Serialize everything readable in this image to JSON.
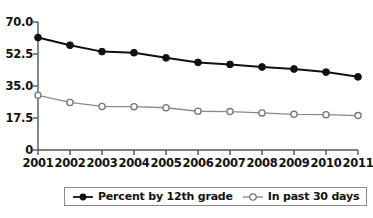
{
  "chart_data": {
    "type": "line",
    "title": "",
    "xlabel": "",
    "ylabel": "",
    "categories": [
      "2001",
      "2002",
      "2003",
      "2004",
      "2005",
      "2006",
      "2007",
      "2008",
      "2009",
      "2010",
      "2011"
    ],
    "x": [
      2001,
      2002,
      2003,
      2004,
      2005,
      2006,
      2007,
      2008,
      2009,
      2010,
      2011
    ],
    "ylim": [
      0,
      70
    ],
    "xlim": [
      2001,
      2011
    ],
    "grid": false,
    "legend_position": "bottom",
    "yticks": [
      0,
      17.5,
      35.0,
      52.5,
      70.0
    ],
    "ytick_labels": [
      "0",
      "17.5",
      "35.0",
      "52.5",
      "70.0"
    ],
    "xtick_labels": [
      "2001",
      "2002",
      "2003",
      "2004",
      "2005",
      "2006",
      "2007",
      "2008",
      "2009",
      "2010",
      "2011"
    ],
    "series": [
      {
        "name": "Percent by 12th grade",
        "marker": "filled-circle",
        "color": "#111111",
        "values": [
          61.5,
          57.3,
          53.8,
          53.2,
          50.4,
          47.9,
          46.8,
          45.4,
          44.3,
          42.6,
          40.0
        ]
      },
      {
        "name": "In past 30 days",
        "marker": "open-circle",
        "color": "#8a8a8a",
        "values": [
          29.9,
          26.0,
          23.8,
          23.7,
          23.1,
          21.2,
          21.0,
          20.3,
          19.5,
          19.3,
          18.8
        ]
      }
    ]
  },
  "legend": {
    "items": [
      {
        "label": "Percent by 12th grade",
        "marker": "filled-circle"
      },
      {
        "label": "In past 30 days",
        "marker": "open-circle"
      }
    ]
  },
  "axis": {
    "y_labels": [
      "70.0",
      "52.5",
      "35.0",
      "17.5",
      "0"
    ],
    "x_labels": [
      "2001",
      "2002",
      "2003",
      "2004",
      "2005",
      "2006",
      "2007",
      "2008",
      "2009",
      "2010",
      "2011"
    ]
  },
  "colors": {
    "series_primary": "#111111",
    "series_secondary": "#8a8a8a",
    "axis": "#555555",
    "background": "#ffffff"
  }
}
